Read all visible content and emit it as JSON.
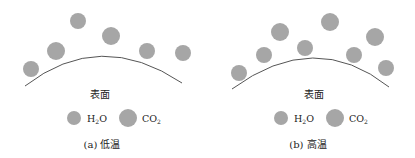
{
  "colors": {
    "molecule": "#a6a6a6",
    "surface_line": "#555555",
    "text": "#222222"
  },
  "panels": [
    {
      "id": "a",
      "surface_label": "表面",
      "caption": "(a) 低温",
      "legend": {
        "h2o": "H2O",
        "co2": "CO2"
      },
      "molecules": [
        {
          "type": "H2O",
          "cx": 31,
          "cy": 69,
          "r": 8
        },
        {
          "type": "CO2",
          "cx": 56,
          "cy": 51,
          "r": 9
        },
        {
          "type": "H2O",
          "cx": 78,
          "cy": 21,
          "r": 8
        },
        {
          "type": "CO2",
          "cx": 111,
          "cy": 36,
          "r": 9
        },
        {
          "type": "H2O",
          "cx": 147,
          "cy": 51,
          "r": 8
        },
        {
          "type": "H2O",
          "cx": 183,
          "cy": 53,
          "r": 8
        }
      ]
    },
    {
      "id": "b",
      "surface_label": "表面",
      "caption": "(b) 高温",
      "legend": {
        "h2o": "H2O",
        "co2": "CO2"
      },
      "molecules": [
        {
          "type": "H2O",
          "cx": 239,
          "cy": 73,
          "r": 8
        },
        {
          "type": "H2O",
          "cx": 264,
          "cy": 55,
          "r": 8
        },
        {
          "type": "CO2",
          "cx": 280,
          "cy": 32,
          "r": 9
        },
        {
          "type": "H2O",
          "cx": 305,
          "cy": 48,
          "r": 8
        },
        {
          "type": "CO2",
          "cx": 330,
          "cy": 22,
          "r": 9
        },
        {
          "type": "H2O",
          "cx": 354,
          "cy": 55,
          "r": 8
        },
        {
          "type": "CO2",
          "cx": 375,
          "cy": 37,
          "r": 9
        },
        {
          "type": "H2O",
          "cx": 386,
          "cy": 68,
          "r": 8
        }
      ]
    }
  ]
}
